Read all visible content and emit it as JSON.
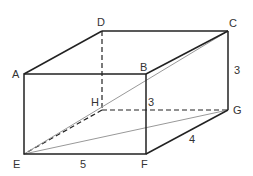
{
  "diagram": {
    "vertices": {
      "A": {
        "label": "A",
        "x": 24,
        "y": 74
      },
      "B": {
        "label": "B",
        "x": 146,
        "y": 74
      },
      "C": {
        "label": "C",
        "x": 228,
        "y": 31
      },
      "D": {
        "label": "D",
        "x": 102,
        "y": 31
      },
      "E": {
        "label": "E",
        "x": 24,
        "y": 154
      },
      "F": {
        "label": "F",
        "x": 146,
        "y": 154
      },
      "G": {
        "label": "G",
        "x": 228,
        "y": 110
      },
      "H": {
        "label": "H",
        "x": 102,
        "y": 110
      }
    },
    "dimensions": {
      "EF": "5",
      "FG": "4",
      "CG": "3",
      "BF": "3"
    },
    "colors": {
      "edge": "#222222",
      "diagonal": "#999999",
      "label": "#333333"
    }
  }
}
